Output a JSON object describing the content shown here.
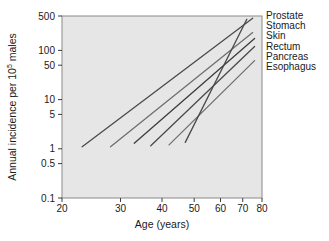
{
  "chart_data": {
    "type": "line",
    "title": "",
    "xlabel": "Age (years)",
    "ylabel": "Annual incidence per 10⁵ males",
    "ylabel_base": "Annual incidence per 10",
    "ylabel_sup": "5",
    "ylabel_tail": " males",
    "xscale": "log",
    "yscale": "log",
    "xlim": [
      20,
      80
    ],
    "ylim": [
      0.1,
      500
    ],
    "xticks": [
      20,
      30,
      40,
      50,
      60,
      70,
      80
    ],
    "xtick_labels": [
      "20",
      "30",
      "40",
      "50",
      "60",
      "70",
      "80"
    ],
    "yticks": [
      0.1,
      0.5,
      1,
      5,
      10,
      50,
      100,
      500
    ],
    "ytick_labels": [
      "0.1",
      "0.5",
      "1",
      "5",
      "10",
      "50",
      "100",
      "500"
    ],
    "grid": false,
    "legend_position": "right-of-axes-line-ends",
    "series": [
      {
        "name": "Prostate",
        "color": "#4a4a4a",
        "points": [
          [
            23,
            1.1
          ],
          [
            75,
            450
          ]
        ],
        "x_start": 23,
        "y_start": 1.1,
        "x_end": 75,
        "y_end": 450
      },
      {
        "name": "Stomach",
        "color": "#6e6e6e",
        "points": [
          [
            28,
            1.1
          ],
          [
            75,
            230
          ]
        ],
        "x_start": 28,
        "y_start": 1.1,
        "x_end": 75,
        "y_end": 230
      },
      {
        "name": "Skin",
        "color": "#3c3c3c",
        "points": [
          [
            33,
            1.3
          ],
          [
            76,
            175
          ]
        ],
        "x_start": 33,
        "y_start": 1.3,
        "x_end": 76,
        "y_end": 175
      },
      {
        "name": "Rectum",
        "color": "#4a4a4a",
        "points": [
          [
            37,
            1.15
          ],
          [
            76,
            120
          ]
        ],
        "x_start": 37,
        "y_start": 1.15,
        "x_end": 76,
        "y_end": 120
      },
      {
        "name": "Pancreas",
        "color": "#6e6e6e",
        "points": [
          [
            42,
            1.2
          ],
          [
            76,
            62
          ]
        ],
        "x_start": 42,
        "y_start": 1.2,
        "x_end": 76,
        "y_end": 62
      },
      {
        "name": "Esophagus",
        "color": "#4a4a4a",
        "points": [
          [
            47,
            1.35
          ],
          [
            72,
            430
          ]
        ],
        "x_start": 47,
        "y_start": 1.35,
        "x_end": 72,
        "y_end": 430
      }
    ],
    "legend_entries": [
      "Prostate",
      "Stomach",
      "Skin",
      "Rectum",
      "Pancreas",
      "Esophagus"
    ],
    "plot_background_color": "#e6e6e6",
    "line_color_default": "#4a4a4a"
  }
}
